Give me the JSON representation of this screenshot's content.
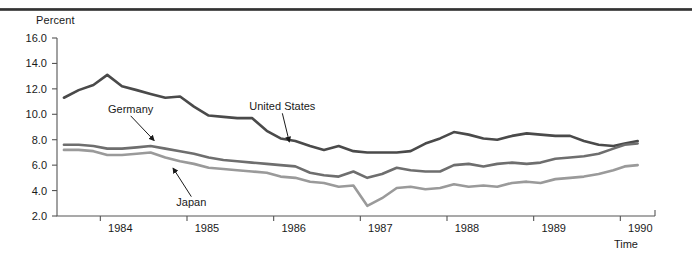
{
  "chart_data": {
    "type": "line",
    "title": "",
    "xlabel": "Time",
    "ylabel": "Percent",
    "ylim": [
      2.0,
      16.0
    ],
    "xlim": [
      1983.5,
      1990.4
    ],
    "grid": false,
    "legend": "annotations-on-plot",
    "ytick_labels": [
      "16.0",
      "14.0",
      "12.0",
      "10.0",
      "8.0",
      "6.0",
      "4.0",
      "2.0"
    ],
    "ytick_values": [
      16.0,
      14.0,
      12.0,
      10.0,
      8.0,
      6.0,
      4.0,
      2.0
    ],
    "xtick_labels": [
      "1984",
      "1985",
      "1986",
      "1987",
      "1988",
      "1989",
      "1990"
    ],
    "xtick_values": [
      1984,
      1985,
      1986,
      1987,
      1988,
      1989,
      1990
    ],
    "annotations": [
      {
        "label": "Germany",
        "series": "Germany",
        "x": 1984.35,
        "y": 10.35,
        "point_x": 1984.62,
        "point_y": 7.55
      },
      {
        "label": "Japan",
        "series": "Japan",
        "x": 1985.05,
        "y": 3.05,
        "point_x": 1984.84,
        "point_y": 6.15
      },
      {
        "label": "United States",
        "series": "United States",
        "x": 1986.1,
        "y": 10.55,
        "point_x": 1986.18,
        "point_y": 7.45
      }
    ],
    "series": [
      {
        "name": "United States",
        "color": "#4a4a4a",
        "x": [
          1983.58,
          1983.75,
          1983.92,
          1984.08,
          1984.25,
          1984.42,
          1984.58,
          1984.75,
          1984.92,
          1985.08,
          1985.25,
          1985.42,
          1985.58,
          1985.75,
          1985.92,
          1986.08,
          1986.25,
          1986.42,
          1986.58,
          1986.75,
          1986.92,
          1987.08,
          1987.25,
          1987.42,
          1987.58,
          1987.75,
          1987.92,
          1988.08,
          1988.25,
          1988.42,
          1988.58,
          1988.75,
          1988.92,
          1989.08,
          1989.25,
          1989.42,
          1989.58,
          1989.75,
          1989.92,
          1990.05,
          1990.2
        ],
        "y": [
          11.3,
          11.9,
          12.3,
          13.1,
          12.2,
          11.9,
          11.6,
          11.3,
          11.4,
          10.6,
          9.9,
          9.8,
          9.7,
          9.7,
          8.7,
          8.1,
          7.9,
          7.5,
          7.2,
          7.5,
          7.1,
          7.0,
          7.0,
          7.0,
          7.1,
          7.7,
          8.1,
          8.6,
          8.4,
          8.1,
          8.0,
          8.3,
          8.5,
          8.4,
          8.3,
          8.3,
          7.9,
          7.6,
          7.5,
          7.7,
          7.9
        ]
      },
      {
        "name": "Germany",
        "color": "#6e6e6e",
        "x": [
          1983.58,
          1983.75,
          1983.92,
          1984.08,
          1984.25,
          1984.42,
          1984.58,
          1984.75,
          1984.92,
          1985.08,
          1985.25,
          1985.42,
          1985.58,
          1985.75,
          1985.92,
          1986.08,
          1986.25,
          1986.42,
          1986.58,
          1986.75,
          1986.92,
          1987.08,
          1987.25,
          1987.42,
          1987.58,
          1987.75,
          1987.92,
          1988.08,
          1988.25,
          1988.42,
          1988.58,
          1988.75,
          1988.92,
          1989.08,
          1989.25,
          1989.42,
          1989.58,
          1989.75,
          1989.92,
          1990.05,
          1990.2
        ],
        "y": [
          7.6,
          7.6,
          7.5,
          7.3,
          7.3,
          7.4,
          7.5,
          7.3,
          7.1,
          6.9,
          6.6,
          6.4,
          6.3,
          6.2,
          6.1,
          6.0,
          5.9,
          5.4,
          5.2,
          5.1,
          5.5,
          5.0,
          5.3,
          5.8,
          5.6,
          5.5,
          5.5,
          6.0,
          6.1,
          5.9,
          6.1,
          6.2,
          6.1,
          6.2,
          6.5,
          6.6,
          6.7,
          6.9,
          7.3,
          7.6,
          7.7
        ]
      },
      {
        "name": "Japan",
        "color": "#9a9a9a",
        "x": [
          1983.58,
          1983.75,
          1983.92,
          1984.08,
          1984.25,
          1984.42,
          1984.58,
          1984.75,
          1984.92,
          1985.08,
          1985.25,
          1985.42,
          1985.58,
          1985.75,
          1985.92,
          1986.08,
          1986.25,
          1986.42,
          1986.58,
          1986.75,
          1986.92,
          1987.08,
          1987.25,
          1987.42,
          1987.58,
          1987.75,
          1987.92,
          1988.08,
          1988.25,
          1988.42,
          1988.58,
          1988.75,
          1988.92,
          1989.08,
          1989.25,
          1989.42,
          1989.58,
          1989.75,
          1989.92,
          1990.05,
          1990.2
        ],
        "y": [
          7.2,
          7.2,
          7.1,
          6.8,
          6.8,
          6.9,
          7.0,
          6.6,
          6.3,
          6.1,
          5.8,
          5.7,
          5.6,
          5.5,
          5.4,
          5.1,
          5.0,
          4.7,
          4.6,
          4.3,
          4.4,
          2.8,
          3.4,
          4.2,
          4.3,
          4.1,
          4.2,
          4.5,
          4.3,
          4.4,
          4.3,
          4.6,
          4.7,
          4.6,
          4.9,
          5.0,
          5.1,
          5.3,
          5.6,
          5.9,
          6.0
        ]
      }
    ]
  }
}
